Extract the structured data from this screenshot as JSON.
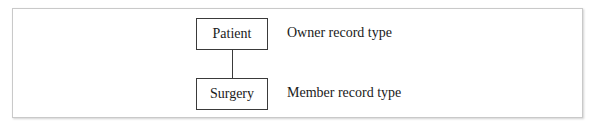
{
  "diagram": {
    "type": "owner-member set relationship",
    "owner": {
      "name": "Patient",
      "description": "Owner record type"
    },
    "member": {
      "name": "Surgery",
      "description": "Member record type"
    },
    "colors": {
      "line": "#3a3a3a",
      "frame_border": "#c9c9c9",
      "text": "#1a1a1a",
      "background": "#ffffff"
    }
  }
}
